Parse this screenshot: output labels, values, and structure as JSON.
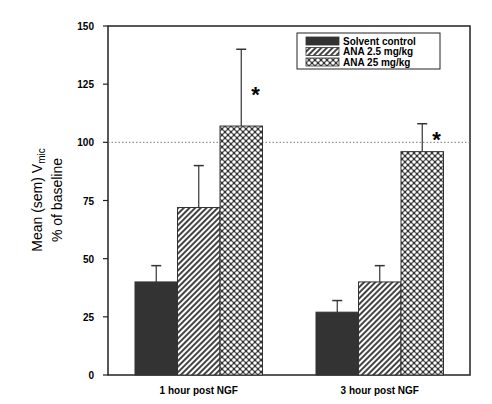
{
  "chart_data": {
    "type": "bar",
    "title": "",
    "xlabel": "",
    "ylabel": "Mean (sem) V",
    "ylabel_subscript": "mic",
    "ylabel_line2": "% of baseline",
    "ylim": [
      0,
      150
    ],
    "yticks": [
      0,
      25,
      50,
      75,
      100,
      125,
      150
    ],
    "grid": false,
    "reference_line": {
      "y": 100,
      "style": "dotted"
    },
    "legend_position": "top-right",
    "categories": [
      "1 hour post NGF",
      "3 hour post NGF"
    ],
    "series": [
      {
        "name": "Solvent control",
        "pattern": "solid-dark",
        "values": [
          40,
          27
        ],
        "sem": [
          7,
          5
        ]
      },
      {
        "name": "ANA 2.5 mg/kg",
        "pattern": "diagonal-hatch",
        "values": [
          72,
          40
        ],
        "sem": [
          18,
          7
        ]
      },
      {
        "name": "ANA 25 mg/kg",
        "pattern": "crosshatch",
        "values": [
          107,
          96
        ],
        "sem": [
          33,
          12
        ]
      }
    ],
    "annotations": [
      {
        "text": "*",
        "category": "1 hour post NGF",
        "series": "ANA 25 mg/kg"
      },
      {
        "text": "*",
        "category": "3 hour post NGF",
        "series": "ANA 25 mg/kg"
      }
    ]
  },
  "colors": {
    "solid": "#333333",
    "axis": "#222222",
    "hatch": "#444444"
  }
}
